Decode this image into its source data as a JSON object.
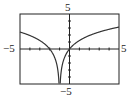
{
  "chart_data": {
    "type": "line",
    "title": "",
    "xlabel": "",
    "ylabel": "",
    "xlim": [
      -5,
      5
    ],
    "ylim": [
      -5,
      5
    ],
    "grid": false,
    "x_tick_step": 1,
    "y_tick_step": 1,
    "tick_labels": {
      "x_min": "−5",
      "x_max": "5",
      "y_min": "−5",
      "y_max": "5"
    },
    "vertical_asymptote": -1,
    "x_intercepts": [
      -2,
      0
    ],
    "series": [
      {
        "name": "f(x)",
        "description": "logarithmic curve symmetric about x = -1, approx y = 1.75 ln|x+1|",
        "x": [
          -5,
          -4,
          -3,
          -2,
          -1.5,
          -1.2,
          -1.05,
          -0.95,
          -0.8,
          -0.5,
          0,
          1,
          2,
          3,
          4,
          5
        ],
        "y": [
          2.4,
          1.9,
          1.2,
          0,
          -1.2,
          -2.8,
          -5,
          -5,
          -2.8,
          -1.2,
          0,
          1.2,
          1.9,
          2.4,
          2.8,
          3.1
        ]
      }
    ]
  },
  "labels": {
    "x_min": "−5",
    "x_max": "5",
    "y_min": "−5",
    "y_max": "5"
  }
}
